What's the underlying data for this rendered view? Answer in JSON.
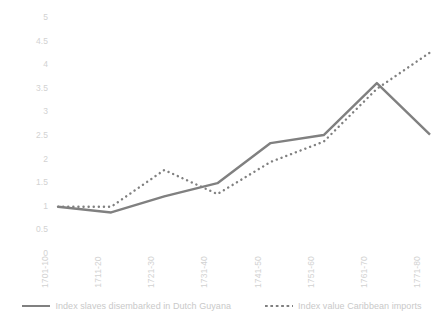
{
  "chart_data": {
    "type": "line",
    "title": "",
    "xlabel": "",
    "ylabel": "",
    "categories": [
      "1701-10",
      "1711-20",
      "1721-30",
      "1731-40",
      "1741-50",
      "1751-60",
      "1761-70",
      "1771-80"
    ],
    "series": [
      {
        "name": "Index slaves disembarked in Dutch Guyana",
        "style": "solid",
        "color": "#808080",
        "values": [
          1.0,
          0.88,
          1.22,
          1.5,
          2.35,
          2.52,
          3.62,
          2.53
        ]
      },
      {
        "name": "Index value Caribbean imports",
        "style": "dotted",
        "color": "#808080",
        "values": [
          1.0,
          1.0,
          1.78,
          1.27,
          1.95,
          2.38,
          3.5,
          4.27
        ]
      }
    ],
    "ylim": [
      0,
      5
    ],
    "ytick_labels": [
      "5",
      "4.5",
      "4",
      "3.5",
      "3",
      "2.5",
      "2",
      "1.5",
      "1",
      "0.5",
      "0"
    ],
    "ytick_values": [
      5,
      4.5,
      4,
      3.5,
      3,
      2.5,
      2,
      1.5,
      1,
      0.5,
      0
    ],
    "grid": false,
    "legend_position": "bottom",
    "axis_text_color": "#d2d2d2",
    "legend_text_color": "#c9c9c9",
    "background": "#ffffff"
  }
}
